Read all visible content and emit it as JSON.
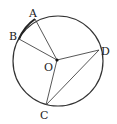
{
  "diagram": {
    "type": "circle-geometry",
    "circle": {
      "cx": 58,
      "cy": 61,
      "r": 45
    },
    "points": {
      "O": {
        "label": "O",
        "x": 57,
        "y": 60
      },
      "A": {
        "label": "A",
        "x": 35,
        "y": 19
      },
      "B": {
        "label": "B",
        "x": 19,
        "y": 39
      },
      "C": {
        "label": "C",
        "x": 46,
        "y": 105
      },
      "D": {
        "label": "D",
        "x": 99,
        "y": 50
      }
    },
    "segments": [
      "OA",
      "OB",
      "OC",
      "OD",
      "CD"
    ],
    "arc_highlight": "AB"
  }
}
